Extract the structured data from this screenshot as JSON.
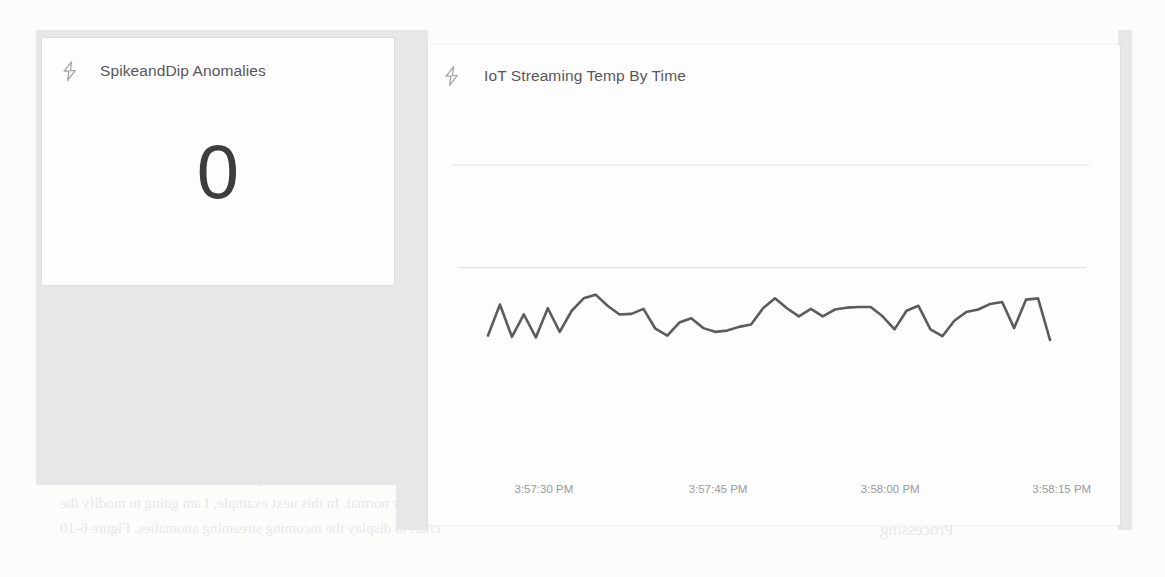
{
  "page": {
    "background_color": "#fcfcfb",
    "canvas_color": "#e7e7e7",
    "bleed_text": [
      {
        "text": "Figure 6-6.  Demo Spike and Dip streaming tile",
        "x": 400,
        "y": 398,
        "size": 17,
        "flip": false
      },
      {
        "text": "As you can see, the cards did not indicate any anomalies; therefore, the values",
        "x": 60,
        "y": 470,
        "size": 15,
        "flip": true
      },
      {
        "text": "in the streaming chart appear normal. In this next example, I am going to modify the",
        "x": 60,
        "y": 495,
        "size": 15,
        "flip": true
      },
      {
        "text": "chart to display the incoming streaming anomalies. Figure 6-10",
        "x": 60,
        "y": 520,
        "size": 15,
        "flip": true
      },
      {
        "text": "that used Spike and",
        "x": 860,
        "y": 470,
        "size": 15,
        "flip": true
      },
      {
        "text": "Processing",
        "x": 880,
        "y": 520,
        "size": 17,
        "flip": true
      }
    ]
  },
  "tiles": [
    {
      "id": "anomalies",
      "icon": "lightning-bolt-icon",
      "title": "SpikeandDip Anomalies",
      "type": "card",
      "value": "0"
    },
    {
      "id": "streaming-temp",
      "icon": "lightning-bolt-icon",
      "title": "IoT Streaming Temp By Time",
      "type": "line-chart"
    }
  ],
  "chart_data": {
    "type": "line",
    "title": "IoT Streaming Temp By Time",
    "xlabel": "",
    "ylabel": "",
    "grid": true,
    "gridlines_y": [
      0.86
    ],
    "legend": null,
    "line_color": "#5c5c5c",
    "line_width": 2.6,
    "axis_label_color": "#9a9a9a",
    "xtick_labels": [
      "3:57:30 PM",
      "3:57:45 PM",
      "3:58:00 PM",
      "3:58:15 PM"
    ],
    "xtick_positions": [
      0.155,
      0.415,
      0.672,
      0.928
    ],
    "x": [
      0,
      1,
      2,
      3,
      4,
      5,
      6,
      7,
      8,
      9,
      10,
      11,
      12,
      13,
      14,
      15,
      16,
      17,
      18,
      19,
      20,
      21,
      22,
      23,
      24,
      25,
      26,
      27,
      28,
      29,
      30,
      31,
      32,
      33,
      34,
      35,
      36,
      37,
      38,
      39,
      40,
      41,
      42,
      43,
      44,
      45,
      46,
      47
    ],
    "values": [
      0.12,
      0.62,
      0.1,
      0.46,
      0.09,
      0.56,
      0.18,
      0.52,
      0.72,
      0.78,
      0.6,
      0.46,
      0.47,
      0.55,
      0.23,
      0.12,
      0.33,
      0.4,
      0.24,
      0.18,
      0.2,
      0.26,
      0.3,
      0.56,
      0.72,
      0.56,
      0.43,
      0.55,
      0.43,
      0.54,
      0.57,
      0.58,
      0.58,
      0.43,
      0.22,
      0.52,
      0.6,
      0.22,
      0.11,
      0.36,
      0.5,
      0.54,
      0.63,
      0.66,
      0.24,
      0.7,
      0.72,
      0.05
    ],
    "ylim": [
      0,
      1
    ]
  }
}
